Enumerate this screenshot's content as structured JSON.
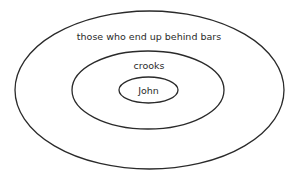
{
  "diagram": {
    "type": "nested-euler",
    "stroke_color": "#2a2a2a",
    "background": "#ffffff",
    "sets": [
      {
        "id": "outer",
        "label": "those who end up behind bars",
        "cx": 149.5,
        "cy": 90,
        "rx": 134.5,
        "ry": 79
      },
      {
        "id": "middle",
        "label": "crooks",
        "cx": 148,
        "cy": 90,
        "rx": 76,
        "ry": 39
      },
      {
        "id": "inner",
        "label": "John",
        "cx": 148.5,
        "cy": 90,
        "rx": 29.5,
        "ry": 13
      }
    ]
  }
}
